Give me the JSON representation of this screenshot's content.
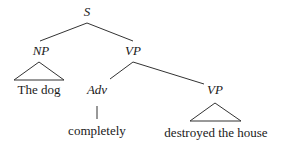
{
  "tree": {
    "root": {
      "label": "S"
    },
    "np": {
      "label": "NP",
      "leaf": "The dog"
    },
    "vp": {
      "label": "VP"
    },
    "adv": {
      "label": "Adv",
      "leaf": "completely"
    },
    "vp2": {
      "label": "VP",
      "leaf": "destroyed the house"
    }
  }
}
